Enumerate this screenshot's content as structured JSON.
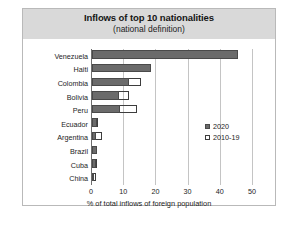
{
  "chart_data": {
    "type": "bar",
    "orientation": "horizontal",
    "title": "Inflows of top 10 nationalities",
    "subtitle": "(national definition)",
    "xlabel": "% of total inflows of foreign population",
    "ylabel": "",
    "xlim": [
      0,
      50
    ],
    "xticks": [
      0,
      10,
      20,
      30,
      40,
      50
    ],
    "grid": true,
    "legend_position": "middle-right",
    "categories": [
      "Venezuela",
      "Haiti",
      "Colombia",
      "Bolivia",
      "Peru",
      "Ecuador",
      "Argentina",
      "Brazil",
      "Cuba",
      "China"
    ],
    "series": [
      {
        "name": "2020",
        "color": "#6b6b6b",
        "values": [
          45.3,
          18.3,
          11.5,
          8.4,
          8.7,
          1.6,
          1.2,
          1.5,
          1.3,
          0.5
        ]
      },
      {
        "name": "2010-19",
        "color": "#ffffff",
        "values": [
          28.3,
          10.5,
          15.2,
          11.5,
          14.0,
          2.0,
          3.0,
          1.6,
          1.4,
          1.3
        ]
      }
    ]
  },
  "legend": {
    "items": [
      {
        "label": "2020"
      },
      {
        "label": "2010-19"
      }
    ]
  }
}
